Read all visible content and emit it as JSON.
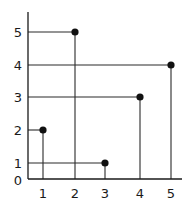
{
  "chart_data": {
    "type": "scatter",
    "title": "",
    "xlabel": "",
    "ylabel": "",
    "x_ticks": [
      "1",
      "2",
      "3",
      "4",
      "5"
    ],
    "y_ticks": [
      "0",
      "1",
      "2",
      "3",
      "4",
      "5"
    ],
    "xlim": [
      0,
      5
    ],
    "ylim": [
      0,
      5
    ],
    "grid": false,
    "legend": null,
    "points": [
      {
        "x": 1,
        "y": 2
      },
      {
        "x": 2,
        "y": 5
      },
      {
        "x": 3,
        "y": 1
      },
      {
        "x": 4,
        "y": 3
      },
      {
        "x": 5,
        "y": 4
      }
    ],
    "annotations": "Each point has drop lines to the x-axis and y-axis"
  },
  "colors": {
    "ink": "#1a1a1a",
    "background": "#ffffff"
  },
  "layout": {
    "axis_x_px": 28,
    "axis_top_px": 12,
    "baseline_px": 179,
    "axis_right_px": 182,
    "x_px": {
      "1": 43,
      "2": 75,
      "3": 105,
      "4": 140,
      "5": 171
    },
    "y_px": {
      "1": 163,
      "2": 130,
      "3": 97,
      "4": 65,
      "5": 32
    }
  }
}
